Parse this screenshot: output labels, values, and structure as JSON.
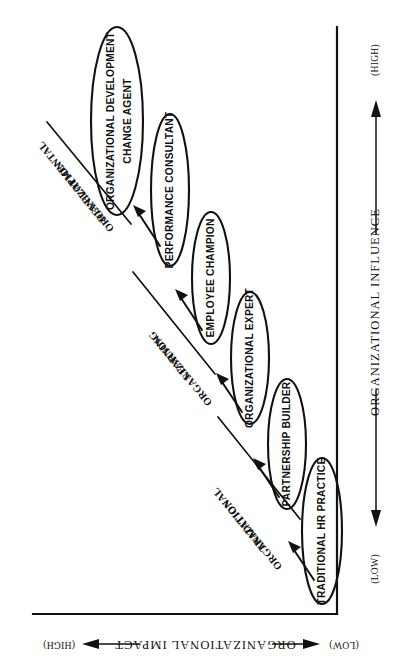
{
  "figure": {
    "orientation": "rotated-90-clockwise",
    "background_color": "#ffffff",
    "ink_color": "#111111"
  },
  "axes": {
    "vertical": {
      "name": "ORGANIZATIONAL INFLUENCE",
      "low_label": "(LOW)",
      "high_label": "(HIGH)"
    },
    "horizontal": {
      "name": "ORGANIZATIONAL IMPACT",
      "low_label": "(LOW)",
      "high_label": "(HIGH)"
    }
  },
  "nodes": [
    {
      "id": "traditional-hr-practice",
      "line1": "TRADITIONAL HR PRACTICE",
      "line2": ""
    },
    {
      "id": "partnership-builder",
      "line1": "PARTNERSHIP BUILDER",
      "line2": ""
    },
    {
      "id": "organizational-expert",
      "line1": "ORGANIZATIONAL EXPERT",
      "line2": ""
    },
    {
      "id": "employee-champion",
      "line1": "EMPLOYEE CHAMPION",
      "line2": ""
    },
    {
      "id": "performance-consultant",
      "line1": "PERFORMANCE CONSULTANT",
      "line2": ""
    },
    {
      "id": "organizational-development-change-agent",
      "line1": "ORGANIZATIONAL DEVELOPMENT",
      "line2": "CHANGE AGENT"
    }
  ],
  "zones": [
    {
      "id": "traditional-organization",
      "line1": "TRADITIONAL",
      "line2": "ORGANIZATION"
    },
    {
      "id": "learning-organization",
      "line1": "LEARNING",
      "line2": "ORGANIZATION"
    },
    {
      "id": "developmental-organization",
      "line1": "DEVELOPMENTAL",
      "line2": "ORGANIZATION"
    }
  ]
}
